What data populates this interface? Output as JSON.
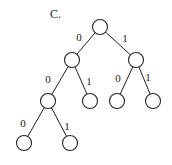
{
  "diagram": {
    "title": "C.",
    "title_pos": [
      50,
      18
    ],
    "node_radius": 7.5,
    "nodes": [
      {
        "id": "root",
        "x": 100,
        "y": 27
      },
      {
        "id": "n0",
        "x": 72,
        "y": 60
      },
      {
        "id": "n1",
        "x": 136,
        "y": 60
      },
      {
        "id": "n00",
        "x": 48,
        "y": 101
      },
      {
        "id": "n01",
        "x": 90,
        "y": 101
      },
      {
        "id": "n10",
        "x": 117,
        "y": 101
      },
      {
        "id": "n11",
        "x": 153,
        "y": 101
      },
      {
        "id": "n000",
        "x": 24,
        "y": 143
      },
      {
        "id": "n001",
        "x": 70,
        "y": 143
      }
    ],
    "edges": [
      {
        "from": "root",
        "to": "n0",
        "label": "0",
        "lx": 79,
        "ly": 41
      },
      {
        "from": "root",
        "to": "n1",
        "label": "1",
        "lx": 125,
        "ly": 42
      },
      {
        "from": "n0",
        "to": "n00",
        "label": "0",
        "lx": 48,
        "ly": 83
      },
      {
        "from": "n0",
        "to": "n01",
        "label": "1",
        "lx": 89,
        "ly": 85
      },
      {
        "from": "n1",
        "to": "n10",
        "label": "0",
        "lx": 118,
        "ly": 82
      },
      {
        "from": "n1",
        "to": "n11",
        "label": "1",
        "lx": 148,
        "ly": 81
      },
      {
        "from": "n00",
        "to": "n000",
        "label": "0",
        "lx": 23,
        "ly": 127
      },
      {
        "from": "n00",
        "to": "n001",
        "label": "1",
        "lx": 67,
        "ly": 130
      }
    ]
  }
}
